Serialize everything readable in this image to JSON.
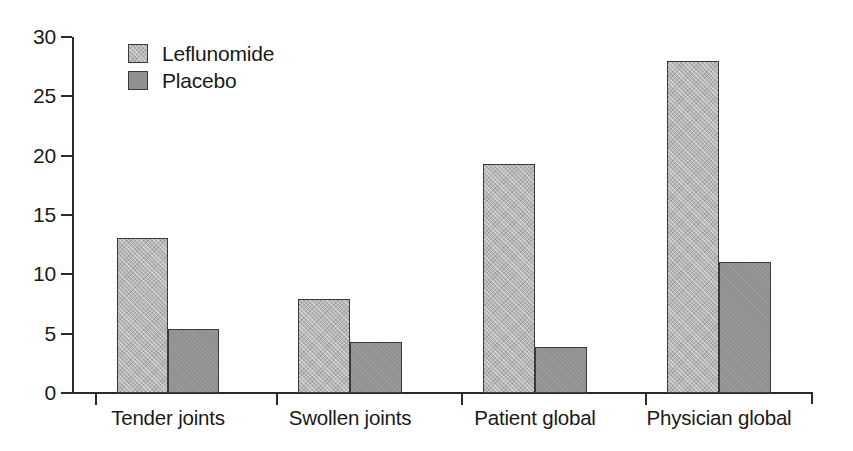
{
  "chart_data": {
    "type": "bar",
    "title": "",
    "xlabel": "",
    "ylabel": "",
    "ylim": [
      0,
      30
    ],
    "yticks": [
      0,
      5,
      10,
      15,
      20,
      25,
      30
    ],
    "ytick_labels": [
      "0",
      "5",
      "10",
      "15",
      "20",
      "25",
      "30"
    ],
    "grid": false,
    "legend_position": "top-left",
    "categories": [
      "Tender joints",
      "Swollen joints",
      "Patient global",
      "Physician global"
    ],
    "series": [
      {
        "name": "Leflunomide",
        "color": "#b6b6b6",
        "fill": "light-gray-hatched",
        "values": [
          13.1,
          7.9,
          19.3,
          28.0
        ]
      },
      {
        "name": "Placebo",
        "color": "#909090",
        "fill": "dark-gray-solid",
        "values": [
          5.4,
          4.3,
          3.9,
          11.0
        ]
      }
    ]
  },
  "legend": {
    "entries": [
      {
        "label": "Leflunomide"
      },
      {
        "label": "Placebo"
      }
    ]
  }
}
